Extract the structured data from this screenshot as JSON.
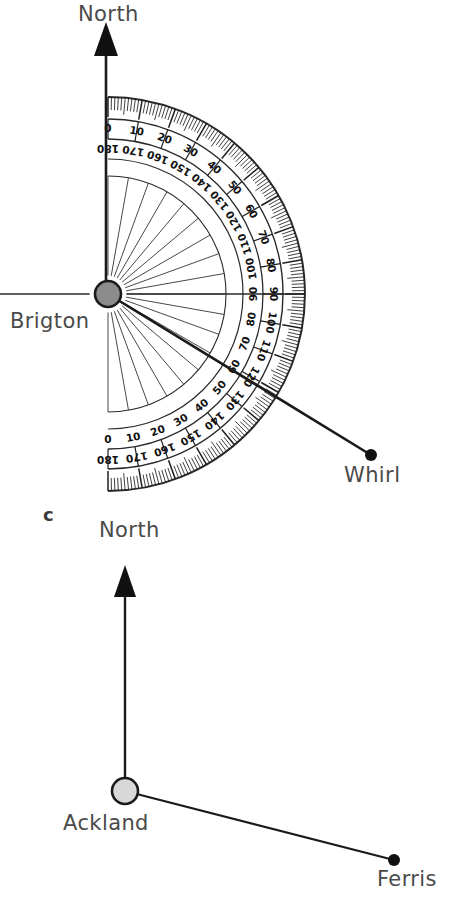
{
  "figure": {
    "part_letter": "c",
    "background_color": "#ffffff",
    "ink_color": "#222222",
    "label_color": "#4a4a4a"
  },
  "diagram_top": {
    "name": "brigton-whirl-bearing-diagram",
    "north_label": "North",
    "origin_label": "Brigton",
    "target_label": "Whirl",
    "origin_marker": {
      "cx": 108,
      "cy": 294,
      "r": 13,
      "fill": "#8c8c8c",
      "stroke": "#1a1a1a"
    },
    "target_marker": {
      "cx": 371,
      "cy": 455,
      "r": 6,
      "fill": "#111111"
    },
    "north_arrow": {
      "x": 106,
      "tip_y": 22,
      "tail_y": 294
    },
    "bearing_line": {
      "from_x": 108,
      "from_y": 294,
      "to_x": 371,
      "to_y": 455
    },
    "protractor": {
      "cx": 108,
      "cy": 294,
      "outer_radius": 197,
      "inner_radius": 118,
      "rotation_deg": 0,
      "outer_scale_labels": [
        "0",
        "10",
        "20",
        "30",
        "40",
        "50",
        "60",
        "70",
        "80",
        "90",
        "100",
        "110",
        "120",
        "130",
        "140",
        "150",
        "160",
        "170",
        "180"
      ],
      "inner_scale_labels": [
        "180",
        "170",
        "160",
        "150",
        "140",
        "130",
        "120",
        "110",
        "100",
        "90",
        "80",
        "70",
        "60",
        "50",
        "40",
        "30",
        "20",
        "10",
        "0"
      ],
      "major_tick_step_deg": 10,
      "minor_tick_step_deg": 1,
      "radial_spoke_step_deg": 10
    }
  },
  "diagram_bottom": {
    "name": "ackland-ferris-bearing-diagram",
    "north_label": "North",
    "origin_label": "Ackland",
    "target_label": "Ferris",
    "origin_marker": {
      "cx": 125,
      "cy": 791,
      "r": 13,
      "fill": "#d8d8d8",
      "stroke": "#1a1a1a"
    },
    "target_marker": {
      "cx": 394,
      "cy": 860,
      "r": 6,
      "fill": "#111111"
    },
    "north_arrow": {
      "x": 125,
      "tip_y": 565,
      "tail_y": 791
    },
    "bearing_line": {
      "from_x": 125,
      "from_y": 791,
      "to_x": 394,
      "to_y": 860
    }
  },
  "labels": [
    {
      "id": "north-top",
      "text": "North",
      "x": 78,
      "y": 2
    },
    {
      "id": "brigton",
      "text": "Brigton",
      "x": 10,
      "y": 310
    },
    {
      "id": "whirl",
      "text": "Whirl",
      "x": 344,
      "y": 464
    },
    {
      "id": "part-c",
      "text": "c",
      "x": 42,
      "y": 503
    },
    {
      "id": "north-bottom",
      "text": "North",
      "x": 99,
      "y": 518
    },
    {
      "id": "ackland",
      "text": "Ackland",
      "x": 63,
      "y": 812
    },
    {
      "id": "ferris",
      "text": "Ferris",
      "x": 377,
      "y": 868
    }
  ]
}
